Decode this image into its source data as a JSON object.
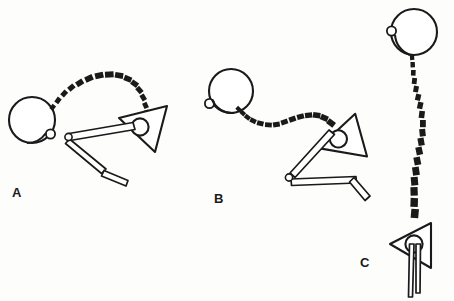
{
  "figure": {
    "background_color": "#fdfdfc",
    "ink_color": "#1a1a1a",
    "width": 454,
    "height": 301,
    "panels": [
      {
        "id": "A",
        "label": "A",
        "label_x": 12,
        "label_y": 186,
        "body": {
          "name": "circle-body-a",
          "shape": "circle",
          "cx": 32,
          "cy": 120,
          "r": 23,
          "nub": {
            "cx": 51,
            "cy": 134,
            "r": 4.5
          }
        },
        "trajectory": {
          "name": "dashed-trajectory-a",
          "style": "dashed-arc",
          "description": "dashed arc rising from the circle, arching over and descending to the arrowhead",
          "points": [
            [
              54,
              108
            ],
            [
              62,
              96
            ],
            [
              72,
              84
            ],
            [
              86,
              76
            ],
            [
              102,
              72
            ],
            [
              118,
              74
            ],
            [
              130,
              82
            ],
            [
              138,
              94
            ],
            [
              142,
              106
            ],
            [
              144,
              116
            ]
          ],
          "dash_sizes": [
            3.6,
            4.2,
            4.8,
            5.4,
            5.6,
            5.4,
            5.0,
            4.6,
            4.2,
            4.0
          ]
        },
        "arrowhead": {
          "name": "arrowhead-a",
          "triangle": [
            [
              122,
              114
            ],
            [
              166,
              108
            ],
            [
              155,
              150
            ]
          ],
          "head": {
            "cx": 139,
            "cy": 128,
            "r": 8.5
          },
          "rotation": -8
        },
        "tail": {
          "name": "zigzag-tail-a",
          "ring": {
            "cx": 70,
            "cy": 137,
            "r": 3.5
          },
          "points": [
            [
              70,
              137
            ],
            [
              134,
              128
            ],
            [
              70,
              141
            ],
            [
              106,
              170
            ],
            [
              89,
              182
            ],
            [
              126,
              176
            ]
          ]
        }
      },
      {
        "id": "B",
        "label": "B",
        "label_x": 214,
        "label_y": 192,
        "body": {
          "name": "circle-body-b",
          "shape": "circle",
          "cx": 230,
          "cy": 91,
          "r": 22,
          "nub": {
            "cx": 209,
            "cy": 104,
            "r": 4.5
          }
        },
        "trajectory": {
          "name": "dashed-trajectory-b",
          "style": "dashed-s-curve",
          "description": "dashed S-shaped path descending from circle then rising to the arrowhead",
          "points": [
            [
              240,
              110
            ],
            [
              248,
              119
            ],
            [
              258,
              124
            ],
            [
              272,
              124
            ],
            [
              286,
              119
            ],
            [
              300,
              114
            ],
            [
              314,
              114
            ],
            [
              326,
              120
            ],
            [
              334,
              126
            ]
          ],
          "dash_sizes": [
            4.0,
            4.4,
            4.8,
            5.0,
            5.2,
            5.2,
            5.4,
            5.6,
            5.8
          ]
        },
        "arrowhead": {
          "name": "arrowhead-b",
          "triangle": [
            [
              322,
              130
            ],
            [
              358,
              116
            ],
            [
              358,
              158
            ]
          ],
          "head": {
            "cx": 338,
            "cy": 136,
            "r": 8.5
          },
          "rotation": -28
        },
        "tail": {
          "name": "zigzag-tail-b",
          "ring": {
            "cx": 289,
            "cy": 177,
            "r": 3.5
          },
          "points": [
            [
              289,
              177
            ],
            [
              336,
              137
            ],
            [
              290,
              182
            ],
            [
              355,
              181
            ],
            [
              366,
              196
            ]
          ]
        }
      },
      {
        "id": "C",
        "label": "C",
        "label_x": 360,
        "label_y": 256,
        "body": {
          "name": "circle-body-c",
          "shape": "circle",
          "cx": 414,
          "cy": 31,
          "r": 23,
          "nub": {
            "cx": 392,
            "cy": 31,
            "r": 4.5
          }
        },
        "trajectory": {
          "name": "dashed-trajectory-c",
          "style": "dashed-vertical-wave",
          "description": "dashed vertical wavy path descending from the circle down to the arrowhead",
          "points": [
            [
              414,
              57
            ],
            [
              416,
              70
            ],
            [
              419,
              84
            ],
            [
              423,
              98
            ],
            [
              425,
              112
            ],
            [
              424,
              126
            ],
            [
              421,
              140
            ],
            [
              418,
              154
            ],
            [
              415,
              168
            ],
            [
              413,
              182
            ],
            [
              412,
              196
            ],
            [
              413,
              208
            ]
          ],
          "dash_sizes": [
            3.2,
            3.6,
            4.0,
            4.4,
            4.8,
            5.2,
            5.6,
            6.0,
            6.4,
            6.8,
            7.2,
            7.4
          ]
        },
        "arrowhead": {
          "name": "arrowhead-c",
          "triangle": [
            [
              392,
              240
            ],
            [
              429,
              225
            ],
            [
              429,
              265
            ]
          ],
          "head": {
            "cx": 413,
            "cy": 243,
            "r": 8.5
          },
          "rotation": 0
        },
        "tail": {
          "name": "straight-tail-c",
          "ring": null,
          "points": [
            [
              413,
              243
            ],
            [
              412,
              296
            ],
            [
              418,
              243
            ],
            [
              418,
              292
            ]
          ]
        }
      }
    ]
  }
}
